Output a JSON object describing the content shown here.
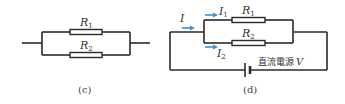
{
  "figure_c": {
    "caption": "(c)",
    "resistors": [
      {
        "name": "R",
        "sub": "1"
      },
      {
        "name": "R",
        "sub": "2"
      }
    ]
  },
  "figure_d": {
    "caption": "(d)",
    "resistors": [
      {
        "name": "R",
        "sub": "1"
      },
      {
        "name": "R",
        "sub": "2"
      }
    ],
    "currents": [
      {
        "name": "I",
        "sub": ""
      },
      {
        "name": "I",
        "sub": "1"
      },
      {
        "name": "I",
        "sub": "2"
      }
    ],
    "source_label": "直流電源",
    "source_var": "V"
  },
  "colors": {
    "wire": "#2a2a2a",
    "arrow": "#3a8fd6"
  }
}
